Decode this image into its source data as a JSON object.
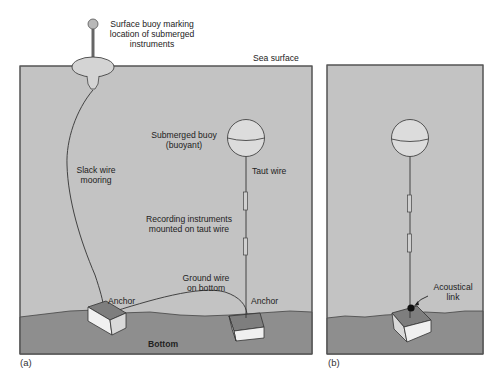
{
  "figure": {
    "colors": {
      "water": "#c3c3c3",
      "seabed": "#8e8e8e",
      "buoy_fill": "#dcdcdc",
      "outline": "#444444",
      "anchor_top": "#7e7e7e",
      "anchor_side": "#f0f0f0",
      "link_dot": "#111111"
    },
    "panel_a": {
      "tag": "(a)",
      "surface_buoy_label": {
        "line1": "Surface buoy marking",
        "line2": "location of submerged",
        "line3": "instruments"
      },
      "sea_surface_label": "Sea surface",
      "submerged_buoy_label": {
        "line1": "Submerged buoy",
        "line2": "(buoyant)"
      },
      "taut_wire_label": "Taut wire",
      "slack_wire_label": {
        "line1": "Slack wire",
        "line2": "mooring"
      },
      "instruments_label": {
        "line1": "Recording instruments",
        "line2": "mounted on taut wire"
      },
      "ground_wire_label": {
        "line1": "Ground wire",
        "line2": "on bottom"
      },
      "anchor_left_label": "Anchor",
      "anchor_right_label": "Anchor",
      "bottom_label": "Bottom"
    },
    "panel_b": {
      "tag": "(b)",
      "acoustical_link_label": {
        "line1": "Acoustical",
        "line2": "link"
      }
    }
  }
}
